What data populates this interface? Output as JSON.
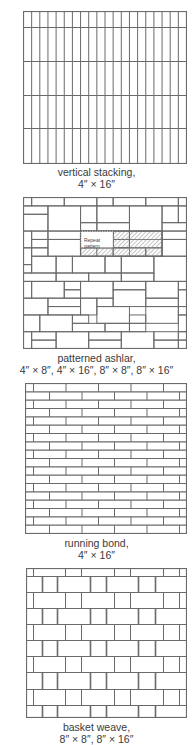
{
  "figures": [
    {
      "id": "vertical-stacking",
      "caption_line1": "vertical stacking,",
      "caption_line2": "4″ × 16″",
      "box": {
        "x": 23,
        "y": 11,
        "w": 163,
        "h": 152
      },
      "columns": 20,
      "row_lines_y": [
        27,
        61,
        95,
        128
      ]
    },
    {
      "id": "patterned-ashlar",
      "caption_line1": "patterned ashlar,",
      "caption_line2": "4″ × 8″, 4″ × 16″, 8″ × 8″, 8″ × 16″",
      "box": {
        "x": 23,
        "y": 197,
        "w": 163,
        "h": 151
      },
      "repeat_label_line1": "Repeat",
      "repeat_label_line2": "pattern"
    },
    {
      "id": "running-bond",
      "caption_line1": "running bond,",
      "caption_line2": "4″ × 16″",
      "box": {
        "x": 25,
        "y": 383,
        "w": 161,
        "h": 150
      },
      "courses": 18,
      "brick_length_px": 32.5
    },
    {
      "id": "basket-weave",
      "caption_line1": "basket weave,",
      "caption_line2": "8″ × 8″, 8″ × 16″",
      "box": {
        "x": 26,
        "y": 568,
        "w": 160,
        "h": 149
      }
    }
  ],
  "colors": {
    "line": "#6a6a6a",
    "hatch": "#9a9a9a",
    "text": "#3a3a3a"
  }
}
